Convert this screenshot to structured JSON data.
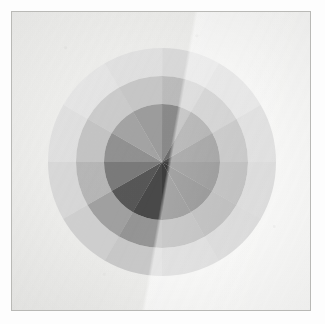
{
  "plate": {
    "title": "Grayscale twelve-hue color wheel",
    "background_color": "#fdfdfd",
    "paper_color": "#f3f3f1",
    "border_color": "#b9b9b6",
    "border_width_px": 1,
    "paper_inset_px": 11
  },
  "chart_data": {
    "type": "pie",
    "subtitle": "Three concentric value rings, twelve sectors each",
    "xlabel": "",
    "ylabel": "",
    "legend": "none",
    "grid": false,
    "center": {
      "x": 150,
      "y": 150
    },
    "sector_count": 12,
    "sector_angle_deg": 30,
    "start_angle_deg": -90,
    "ring_count": 3,
    "rings": [
      {
        "name": "inner-disc",
        "inner_radius": 0,
        "outer_radius": 58,
        "categories": [
          "s1",
          "s2",
          "s3",
          "s4",
          "s5",
          "s6",
          "s7",
          "s8",
          "s9",
          "s10",
          "s11",
          "s12"
        ],
        "values": [
          60,
          47,
          36,
          30,
          28,
          33,
          38,
          45,
          55,
          63,
          70,
          68
        ],
        "colors": [
          "#8f8f8f",
          "#707070",
          "#545454",
          "#434343",
          "#3a3a3a",
          "#3f3f3f",
          "#4b4b4b",
          "#5a5a5a",
          "#7e7e7e",
          "#969696",
          "#a9a9a9",
          "#a2a2a2"
        ]
      },
      {
        "name": "middle-ring",
        "inner_radius": 58,
        "outer_radius": 86,
        "categories": [
          "s1",
          "s2",
          "s3",
          "s4",
          "s5",
          "s6",
          "s7",
          "s8",
          "s9",
          "s10",
          "s11",
          "s12"
        ],
        "values": [
          80,
          72,
          62,
          56,
          54,
          58,
          64,
          70,
          78,
          84,
          88,
          86
        ],
        "colors": [
          "#c2c2c2",
          "#b1b1b1",
          "#9d9d9d",
          "#8e8e8e",
          "#898989",
          "#909090",
          "#9a9a9a",
          "#a6a6a6",
          "#bcbcbc",
          "#cacaca",
          "#d2d2d2",
          "#cdcdcd"
        ]
      },
      {
        "name": "outer-ring",
        "inner_radius": 86,
        "outer_radius": 114,
        "categories": [
          "s1",
          "s2",
          "s3",
          "s4",
          "s5",
          "s6",
          "s7",
          "s8",
          "s9",
          "s10",
          "s11",
          "s12"
        ],
        "values": [
          92,
          88,
          83,
          79,
          78,
          81,
          85,
          88,
          91,
          94,
          96,
          95
        ],
        "colors": [
          "#e0e0e0",
          "#d7d7d7",
          "#cbcbcb",
          "#c3c3c3",
          "#c0c0c0",
          "#c6c6c6",
          "#cfcfcf",
          "#d6d6d6",
          "#dedede",
          "#e6e6e6",
          "#ebebeb",
          "#e7e7e7"
        ]
      }
    ]
  }
}
